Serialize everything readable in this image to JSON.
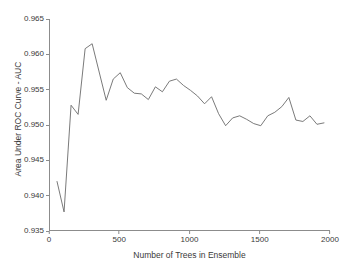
{
  "chart_data": {
    "type": "line",
    "title": "",
    "xlabel": "Number of Trees in Ensemble",
    "ylabel": "Area Under ROC Curve - AUC",
    "xlim": [
      0,
      2000
    ],
    "ylim": [
      0.935,
      0.965
    ],
    "xticks": [
      0,
      500,
      1000,
      1500,
      2000
    ],
    "xtick_labels": [
      "0",
      "500",
      "1000",
      "1500",
      "2000"
    ],
    "yticks": [
      0.935,
      0.94,
      0.945,
      0.95,
      0.955,
      0.96,
      0.965
    ],
    "ytick_labels": [
      "0.935",
      "0.940",
      "0.945",
      "0.950",
      "0.955",
      "0.960",
      "0.965"
    ],
    "grid": false,
    "legend": null,
    "line_color": "#6b6b6b",
    "background_color": "#ffffff",
    "axis_color": "#8c8c8c",
    "series": [
      {
        "name": "AUC vs ensemble size",
        "x": [
          50,
          100,
          150,
          200,
          250,
          300,
          350,
          400,
          450,
          500,
          550,
          600,
          650,
          700,
          750,
          800,
          850,
          900,
          950,
          1000,
          1050,
          1100,
          1150,
          1200,
          1250,
          1300,
          1350,
          1400,
          1450,
          1500,
          1550,
          1600,
          1650,
          1700,
          1750,
          1800,
          1850,
          1900,
          1950
        ],
        "y": [
          0.942,
          0.9377,
          0.9528,
          0.9515,
          0.9608,
          0.9615,
          0.9575,
          0.9535,
          0.9565,
          0.9574,
          0.9553,
          0.9545,
          0.9544,
          0.9536,
          0.9554,
          0.9547,
          0.9562,
          0.9565,
          0.9556,
          0.9549,
          0.9541,
          0.953,
          0.954,
          0.9516,
          0.9499,
          0.951,
          0.9513,
          0.9508,
          0.9502,
          0.9499,
          0.9513,
          0.9518,
          0.9526,
          0.9539,
          0.9507,
          0.9505,
          0.9513,
          0.9501,
          0.9503
        ]
      }
    ]
  }
}
